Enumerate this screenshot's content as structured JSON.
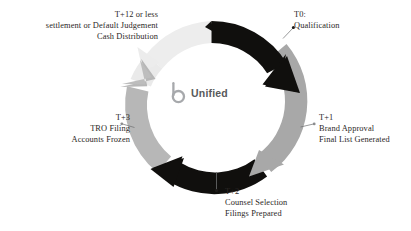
{
  "diagram": {
    "type": "circular-cycle",
    "center_logo": {
      "mark_name": "unified-b-logo-mark",
      "wordmark": "Unified"
    },
    "colors": {
      "arrow_black": "#100f0d",
      "arrow_gray_mid": "#a8a8a8",
      "arrow_gray_light": "#b9b9b9",
      "arrow_gray_pale": "#e8e8e8",
      "text": "#2b2726",
      "logo_text": "#58595b",
      "logo_mark": "#a7a9ac",
      "leader_line": "#6d6e70",
      "background": "#ffffff"
    },
    "segments": [
      {
        "id": "t0",
        "color": "#100f0d",
        "style": "arrow",
        "direction": "clockwise",
        "start_deg": -82,
        "end_deg": 28
      },
      {
        "id": "t1",
        "color": "#a8a8a8",
        "style": "arrow",
        "direction": "clockwise",
        "start_deg": 30,
        "end_deg": 130
      },
      {
        "id": "t2",
        "color": "#100f0d",
        "style": "arrow",
        "direction": "counterclockwise",
        "start_deg": 128,
        "end_deg": 208
      },
      {
        "id": "t3",
        "color": "#b9b9b9",
        "style": "arrow",
        "direction": "counterclockwise",
        "start_deg": 206,
        "end_deg": 290
      },
      {
        "id": "t12",
        "color": "#e8e8e8",
        "style": "arrow",
        "direction": "clockwise",
        "start_deg": 250,
        "end_deg": 278
      }
    ],
    "stages": [
      {
        "id": "t0",
        "marker": "T0:",
        "lines": [
          "T0:",
          "Qualification"
        ],
        "align": "left",
        "leader": true
      },
      {
        "id": "t1",
        "marker": "T+1",
        "lines": [
          "T+1",
          "Brand Approval",
          "Final List Generated"
        ],
        "align": "left",
        "leader": true
      },
      {
        "id": "t2",
        "marker": "T+2",
        "lines": [
          "T+2",
          "Counsel Selection",
          "Filings Prepared"
        ],
        "align": "left",
        "leader": true
      },
      {
        "id": "t3",
        "marker": "T+3",
        "lines": [
          "T+3",
          "TRO Filing",
          "Accounts Frozen"
        ],
        "align": "right",
        "leader": true
      },
      {
        "id": "t12",
        "marker": "T+12 or less",
        "lines": [
          "T+12 or less",
          "settlement or Default Judgement",
          "Cash Distribution"
        ],
        "align": "right",
        "leader": false
      }
    ]
  }
}
